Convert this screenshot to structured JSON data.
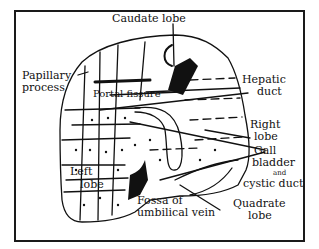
{
  "diagram": {
    "labels": {
      "caudate_lobe": "Caudate lobe",
      "papillary_process_1": "Papillary",
      "papillary_process_2": "process",
      "portal_fissure": "Portal fissure",
      "hepatic_duct_1": "Hepatic",
      "hepatic_duct_2": "duct",
      "right_lobe_1": "Right",
      "right_lobe_2": "lobe",
      "gall_bladder_1": "Gall",
      "gall_bladder_2": "bladder",
      "gall_bladder_and": "and",
      "gall_bladder_3": "cystic duct",
      "left_lobe_1": "Left",
      "left_lobe_2": "lobe",
      "fossa_1": "Fossa of",
      "fossa_2": "umbilical vein",
      "quadrate_lobe_1": "Quadrate",
      "quadrate_lobe_2": "lobe"
    },
    "colors": {
      "ink": "#111111",
      "paper": "#ffffff"
    }
  }
}
